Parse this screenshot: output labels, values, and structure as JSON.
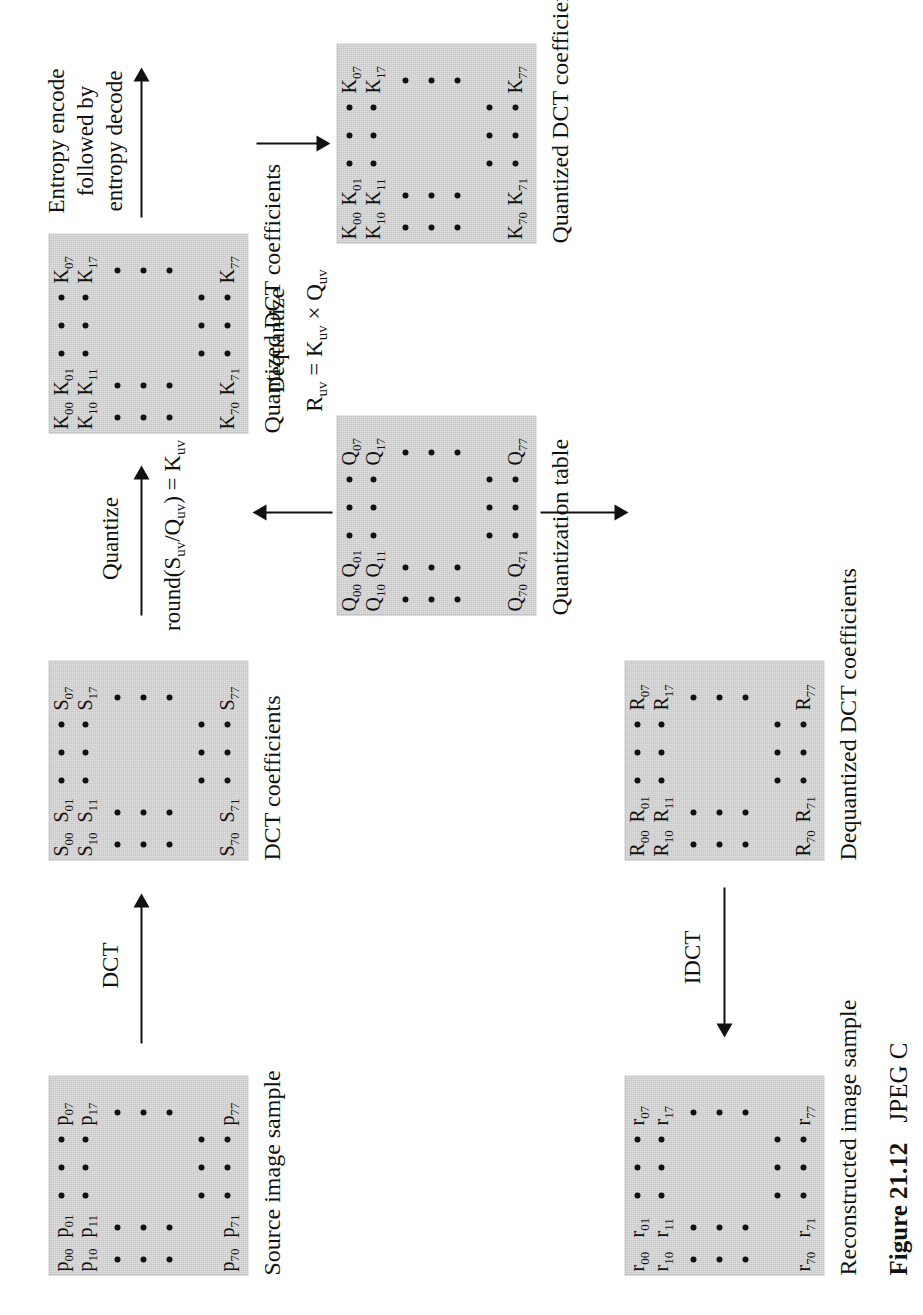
{
  "figure": {
    "caption_label": "Figure 21.12",
    "caption_text": "JPEG C"
  },
  "blocks": [
    {
      "id": "source",
      "caption": "Source image sample",
      "symbol": "p",
      "corner_labels": {
        "top_left": [
          "p00",
          "p01"
        ],
        "second_row": [
          "p10",
          "p11"
        ],
        "top_right": [
          "p07",
          "p17"
        ],
        "bottom_left": [
          "p70",
          "p71"
        ],
        "bottom_right": [
          "p77"
        ]
      }
    },
    {
      "id": "dct",
      "caption": "DCT coefficients",
      "symbol": "S",
      "corner_labels": {
        "top_left": [
          "S00",
          "S01"
        ],
        "second_row": [
          "S10",
          "S11"
        ],
        "top_right": [
          "S07",
          "S17"
        ],
        "bottom_left": [
          "S70",
          "S71"
        ],
        "bottom_right": [
          "S77"
        ]
      }
    },
    {
      "id": "quantized",
      "caption": "Quantized DCT coefficients",
      "symbol": "K",
      "corner_labels": {
        "top_left": [
          "K00",
          "K01"
        ],
        "second_row": [
          "K10",
          "K11"
        ],
        "top_right": [
          "K07",
          "K17"
        ],
        "bottom_left": [
          "K70",
          "K71"
        ],
        "bottom_right": [
          "K77"
        ]
      }
    },
    {
      "id": "quantized2",
      "caption": "Quantized DCT coefficients",
      "symbol": "K",
      "corner_labels": {
        "top_left": [
          "K00",
          "K01"
        ],
        "second_row": [
          "K10",
          "K11"
        ],
        "top_right": [
          "K07",
          "K17"
        ],
        "bottom_left": [
          "K70",
          "K71"
        ],
        "bottom_right": [
          "K77"
        ]
      }
    },
    {
      "id": "qtable",
      "caption": "Quantization table",
      "symbol": "Q",
      "corner_labels": {
        "top_left": [
          "Q00",
          "Q01"
        ],
        "second_row": [
          "Q10",
          "Q11"
        ],
        "top_right": [
          "Q07",
          "Q17"
        ],
        "bottom_left": [
          "Q70",
          "Q71"
        ],
        "bottom_right": [
          "Q77"
        ]
      }
    },
    {
      "id": "dequantized",
      "caption": "Dequantized DCT coefficients",
      "symbol": "R",
      "corner_labels": {
        "top_left": [
          "R00",
          "R01"
        ],
        "second_row": [
          "R10",
          "R11"
        ],
        "top_right": [
          "R07",
          "R17"
        ],
        "bottom_left": [
          "R70",
          "R71"
        ],
        "bottom_right": [
          "R77"
        ]
      }
    },
    {
      "id": "reconstructed",
      "caption": "Reconstructed image sample",
      "symbol": "r",
      "corner_labels": {
        "top_left": [
          "r00",
          "r01"
        ],
        "second_row": [
          "r10",
          "r11"
        ],
        "top_right": [
          "r07",
          "r17"
        ],
        "bottom_left": [
          "r70",
          "r71"
        ],
        "bottom_right": [
          "r77"
        ]
      }
    }
  ],
  "arrows": {
    "dct": {
      "label": "DCT"
    },
    "quantize": {
      "label": "Quantize"
    },
    "quantize_formula": {
      "label": "round(Suv/Quv) = Kuv"
    },
    "entropy": {
      "label_line1": "Entropy encode",
      "label_line2": "followed by",
      "label_line3": "entropy decode"
    },
    "dequantize": {
      "label": "Dequantize"
    },
    "dequantize_formula": {
      "label": "Ruv = Kuv × Quv"
    },
    "idct": {
      "label": "IDCT"
    }
  },
  "colors": {
    "block_fill": "#c9c9c9",
    "ink": "#111111",
    "page": "#ffffff"
  }
}
